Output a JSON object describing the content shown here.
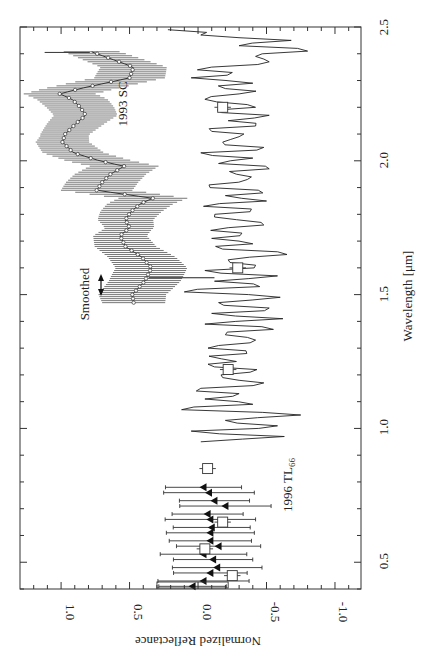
{
  "chart_data": {
    "type": "line",
    "orientation": "rotated-90",
    "xlabel": "Wavelength [μm]",
    "ylabel": "Normalized Reflectance",
    "xlim": [
      0.4,
      2.5
    ],
    "ylim": [
      -1.19,
      1.3
    ],
    "xticks": [
      0.5,
      1.0,
      1.5,
      2.0,
      2.5
    ],
    "xtick_labels": [
      "0.5",
      "1.0",
      "1.5",
      "2.0",
      "2.5"
    ],
    "yticks": [
      1.0,
      0.5,
      0.0,
      -0.5,
      -1.0
    ],
    "ytick_labels": [
      "1.0",
      "0.5",
      "0.0",
      "-0.5",
      "-1.0"
    ],
    "grid": false,
    "annotations": {
      "sc_label": "1993 SC",
      "tl_label_main": "1996 TL",
      "tl_label_sub": "66",
      "smoothed_label": "Smoothed"
    },
    "series": [
      {
        "name": "1993 SC (smoothed)",
        "style": "line-with-open-circles-and-errorbars",
        "error": 0.22,
        "x": [
          1.47,
          1.5,
          1.55,
          1.6,
          1.64,
          1.68,
          1.72,
          1.75,
          1.78,
          1.81,
          1.84,
          1.86,
          1.89,
          1.92,
          1.95,
          1.98,
          2.0,
          2.03,
          2.07,
          2.1,
          2.14,
          2.17,
          2.2,
          2.23,
          2.25,
          2.27,
          2.29,
          2.31,
          2.35,
          2.38,
          2.41
        ],
        "y": [
          0.47,
          0.48,
          0.39,
          0.34,
          0.41,
          0.53,
          0.57,
          0.5,
          0.53,
          0.49,
          0.42,
          0.33,
          0.74,
          0.7,
          0.64,
          0.54,
          0.72,
          0.91,
          0.99,
          0.97,
          0.89,
          0.82,
          0.86,
          0.92,
          1.01,
          0.86,
          0.68,
          0.5,
          0.47,
          0.63,
          0.79
        ]
      },
      {
        "name": "1996 TL66 (spectrum)",
        "style": "line",
        "x": [
          0.95,
          0.97,
          0.99,
          1.01,
          1.03,
          1.05,
          1.07,
          1.09,
          1.11,
          1.13,
          1.15,
          1.17,
          1.19,
          1.21,
          1.23,
          1.25,
          1.27,
          1.29,
          1.31,
          1.33,
          1.35,
          1.37,
          1.39,
          1.41,
          1.43,
          1.45,
          1.47,
          1.49,
          1.51,
          1.53,
          1.55,
          1.57,
          1.59,
          1.61,
          1.63,
          1.65,
          1.67,
          1.69,
          1.71,
          1.73,
          1.75,
          1.77,
          1.79,
          1.81,
          1.83,
          1.85,
          1.87,
          1.89,
          1.91,
          1.93,
          1.95,
          1.97,
          1.99,
          2.01,
          2.03,
          2.05,
          2.07,
          2.09,
          2.11,
          2.13,
          2.15,
          2.17,
          2.19,
          2.21,
          2.23,
          2.25,
          2.27,
          2.29,
          2.31,
          2.33,
          2.35,
          2.37,
          2.39,
          2.41,
          2.43,
          2.45,
          2.47,
          2.49
        ],
        "y": [
          -0.02,
          -0.63,
          0.05,
          -0.58,
          -0.2,
          -0.75,
          0.12,
          -0.4,
          -0.05,
          -0.3,
          -0.02,
          -0.48,
          -0.18,
          -0.38,
          -0.12,
          -0.28,
          -0.08,
          -0.35,
          -0.15,
          -0.42,
          -0.2,
          -0.55,
          -0.05,
          -0.62,
          -0.1,
          -0.52,
          -0.15,
          -0.6,
          0.1,
          -0.45,
          -0.12,
          -0.58,
          -0.05,
          -0.42,
          -0.22,
          -0.65,
          -0.18,
          -0.4,
          -0.1,
          -0.32,
          -0.22,
          -0.46,
          -0.12,
          -0.38,
          -0.04,
          -0.5,
          -0.2,
          -0.44,
          -0.08,
          -0.36,
          -0.28,
          -0.52,
          -0.15,
          -0.4,
          -0.02,
          -0.48,
          -0.18,
          -0.3,
          -0.1,
          -0.42,
          -0.22,
          -0.52,
          -0.14,
          -0.36,
          -0.05,
          -0.3,
          -0.2,
          -0.4,
          0.05,
          -0.25,
          -0.1,
          -0.52,
          -0.42,
          -0.8,
          -0.3,
          -0.68,
          -0.02,
          0.22
        ]
      },
      {
        "name": "1996 TL66 (visible photometry)",
        "style": "filled-triangles-with-errorbars",
        "error": 0.29,
        "x": [
          0.41,
          0.43,
          0.46,
          0.48,
          0.51,
          0.53,
          0.56,
          0.58,
          0.61,
          0.63,
          0.66,
          0.68,
          0.71,
          0.73,
          0.76,
          0.78
        ],
        "y": [
          0.04,
          -0.04,
          -0.09,
          -0.14,
          -0.11,
          -0.04,
          -0.15,
          -0.09,
          -0.09,
          -0.1,
          -0.09,
          -0.07,
          -0.2,
          -0.12,
          -0.08,
          -0.04
        ]
      },
      {
        "name": "1996 TL66 (broadband colors)",
        "style": "open-squares-with-errorbars",
        "error": 0.06,
        "x": [
          0.45,
          0.55,
          0.65,
          0.85,
          1.22,
          1.6,
          2.2
        ],
        "y": [
          -0.25,
          -0.05,
          -0.18,
          -0.07,
          -0.22,
          -0.29,
          -0.18
        ]
      }
    ]
  }
}
